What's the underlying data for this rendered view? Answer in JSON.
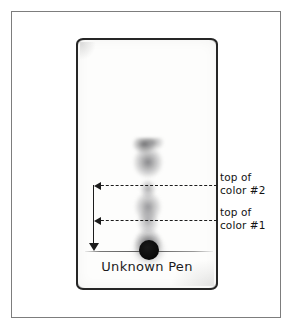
{
  "figure": {
    "strip_caption": "Unknown Pen",
    "annotations": [
      {
        "id": "color2",
        "label_line1": "top of",
        "label_line2": "color #2"
      },
      {
        "id": "color1",
        "label_line1": "top of",
        "label_line2": "color #1"
      }
    ],
    "colors": {
      "frame_stroke": "#7d7d7d",
      "strip_stroke": "#262626",
      "annotation_stroke": "#1c1c1c",
      "text": "#131313",
      "background": "#ffffff",
      "ink_origin": "#0d0d0d",
      "band_gray": "#6c6c70"
    }
  },
  "chart_data": {
    "type": "diagram",
    "subtype": "paper-chromatography",
    "title": "Unknown Pen",
    "axis": {
      "orientation": "vertical",
      "origin_label": "baseline (ink origin spot)",
      "direction": "distance travelled measured upward from baseline"
    },
    "elements": [
      {
        "name": "outer-frame",
        "x": 11,
        "y": 11,
        "width": 270,
        "height": 307
      },
      {
        "name": "paper-strip",
        "x": 76,
        "y": 38,
        "width": 142,
        "height": 252
      },
      {
        "name": "baseline",
        "y": 249
      },
      {
        "name": "origin-spot",
        "x": 71,
        "y": 210,
        "radius": 10
      }
    ],
    "markers": [
      {
        "label": "top of color #2",
        "y_pixel": 185,
        "arrow": "left",
        "style": "dashed"
      },
      {
        "label": "top of color #1",
        "y_pixel": 220,
        "arrow": "left",
        "style": "dashed"
      }
    ],
    "measurement_arrow": {
      "from_y": 185,
      "to_y": 250,
      "direction": "down",
      "x_pixel": 93
    },
    "bands": [
      {
        "name": "color #2 band (upper, diffuse)",
        "top_y": 136,
        "bottom_y": 185,
        "intensity": "medium-dark"
      },
      {
        "name": "intermediate smear",
        "top_y": 185,
        "bottom_y": 220,
        "intensity": "medium"
      },
      {
        "name": "color #1 band (lower)",
        "top_y": 220,
        "bottom_y": 246,
        "intensity": "dark"
      },
      {
        "name": "origin ink spot",
        "top_y": 240,
        "bottom_y": 256,
        "intensity": "black"
      }
    ]
  }
}
